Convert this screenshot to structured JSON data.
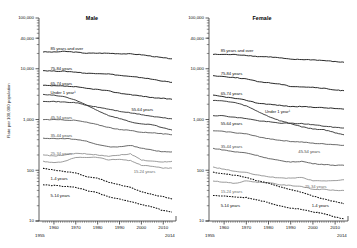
{
  "chart_data": {
    "type": "line",
    "title": "",
    "ylabel": "Rate per 100,000 population",
    "xlabel": "",
    "scale": "log",
    "grid": false,
    "legend_position": "inline-labels",
    "xlim": [
      1955,
      2014
    ],
    "ylim": [
      10,
      100000
    ],
    "ytick_labels": [
      "100,000",
      "40,000",
      "10,000",
      "1,000",
      "100",
      "10"
    ],
    "ytick_values": [
      100000,
      40000,
      10000,
      1000,
      100,
      10
    ],
    "xtick_labels": [
      "1960",
      "1970",
      "1980",
      "1990",
      "2000",
      "2010"
    ],
    "xtick_values": [
      1960,
      1970,
      1980,
      1990,
      2000,
      2010
    ],
    "x_start_label": "1955",
    "x_end_label": "2014",
    "x": [
      1955,
      1960,
      1965,
      1970,
      1975,
      1980,
      1985,
      1990,
      1995,
      2000,
      2005,
      2010,
      2014
    ],
    "panels": [
      {
        "name": "Male",
        "series": [
          {
            "name": "85 years and over",
            "values": [
              21500,
              21300,
              22000,
              21200,
              20200,
              20300,
              20200,
              19800,
              19600,
              18900,
              17600,
              16400,
              15700
            ]
          },
          {
            "name": "75-84 years",
            "values": [
              9200,
              9000,
              8900,
              8600,
              8100,
              8100,
              7900,
              7400,
              7000,
              6700,
              6200,
              5700,
              5400
            ]
          },
          {
            "name": "65-74 years",
            "values": [
              4700,
              4600,
              4550,
              4400,
              4100,
              3900,
              3650,
              3300,
              3100,
              2900,
              2700,
              2600,
              2500
            ]
          },
          {
            "name": "Under 1 year",
            "values": [
              3100,
              3000,
              2800,
              2400,
              1900,
              1500,
              1200,
              1050,
              900,
              810,
              790,
              680,
              620
            ]
          },
          {
            "name": "55-64 years",
            "values": [
              2300,
              2260,
              2200,
              2150,
              1900,
              1750,
              1600,
              1450,
              1350,
              1250,
              1150,
              1080,
              1030
            ]
          },
          {
            "name": "45-54 years",
            "values": [
              1000,
              990,
              980,
              960,
              880,
              790,
              700,
              630,
              610,
              560,
              550,
              520,
              500
            ]
          },
          {
            "name": "35-44 years",
            "values": [
              430,
              420,
              420,
              410,
              370,
              320,
              290,
              290,
              310,
              270,
              250,
              230,
              230
            ]
          },
          {
            "name": "25-34 years",
            "values": [
              200,
              190,
              200,
              215,
              210,
              200,
              190,
              200,
              210,
              160,
              150,
              145,
              150
            ]
          },
          {
            "name": "15-24 years",
            "values": [
              150,
              140,
              150,
              180,
              180,
              180,
              160,
              165,
              155,
              125,
              120,
              110,
              110
            ]
          },
          {
            "name": "1-4 years",
            "values": [
              110,
              100,
              95,
              88,
              75,
              70,
              58,
              52,
              46,
              38,
              33,
              30,
              27
            ]
          },
          {
            "name": "5-14 years",
            "values": [
              52,
              50,
              48,
              46,
              40,
              36,
              30,
              27,
              24,
              21,
              19,
              16,
              15
            ]
          }
        ]
      },
      {
        "name": "Female",
        "series": [
          {
            "name": "85 years and over",
            "values": [
              19200,
              19100,
              19000,
              18400,
              17400,
              17200,
              16400,
              15300,
              15200,
              15000,
              14500,
              13800,
              13400
            ]
          },
          {
            "name": "75-84 years",
            "values": [
              7300,
              7000,
              6700,
              6300,
              5600,
              5300,
              5000,
              4500,
              4400,
              4300,
              4100,
              3800,
              3700
            ]
          },
          {
            "name": "65-74 years",
            "values": [
              3000,
              2800,
              2600,
              2400,
              2100,
              2000,
              1900,
              1800,
              1800,
              1750,
              1700,
              1650,
              1600
            ]
          },
          {
            "name": "Under 1 year",
            "values": [
              2400,
              2300,
              2150,
              1850,
              1450,
              1150,
              950,
              830,
              720,
              650,
              630,
              550,
              500
            ]
          },
          {
            "name": "55-64 years",
            "values": [
              1200,
              1180,
              1100,
              1050,
              950,
              900,
              850,
              840,
              830,
              790,
              740,
              700,
              680
            ]
          },
          {
            "name": "45-54 years",
            "values": [
              600,
              580,
              550,
              520,
              460,
              420,
              390,
              370,
              360,
              340,
              330,
              320,
              310
            ]
          },
          {
            "name": "35-44 years",
            "values": [
              270,
              250,
              230,
              220,
              195,
              170,
              155,
              145,
              150,
              135,
              130,
              125,
              125
            ]
          },
          {
            "name": "25-34 years",
            "values": [
              115,
              105,
              95,
              90,
              80,
              75,
              70,
              70,
              72,
              62,
              62,
              62,
              65
            ]
          },
          {
            "name": "15-24 years",
            "values": [
              62,
              58,
              55,
              62,
              58,
              57,
              52,
              50,
              48,
              42,
              42,
              40,
              40
            ]
          },
          {
            "name": "5-14 years",
            "values": [
              32,
              31,
              30,
              29,
              26,
              23,
              20,
              18,
              17,
              15,
              14,
              12,
              11
            ]
          },
          {
            "name": "1-4 years",
            "values": [
              92,
              85,
              80,
              72,
              62,
              56,
              47,
              42,
              37,
              31,
              27,
              24,
              22
            ]
          }
        ]
      }
    ]
  },
  "axes": {
    "ylabel": "Rate per 100,000 population",
    "yticks": [
      "100,000",
      "40,000",
      "10,000",
      "1,000",
      "100",
      "10"
    ],
    "xticks": [
      "1960",
      "1970",
      "1980",
      "1990",
      "2000",
      "2010"
    ],
    "x_start": "1955",
    "x_end": "2014"
  },
  "panels": {
    "male": {
      "title": "Male",
      "labels": [
        "85 years and over",
        "75-84 years",
        "65-74 years",
        "Under 1 year¹",
        "55-64 years",
        "45-54 years",
        "35-44 years",
        "25-34 years",
        "15-24 years",
        "1-4 years",
        "5-14 years"
      ]
    },
    "female": {
      "title": "Female",
      "labels": [
        "85 years and over",
        "75-84 years",
        "65-74 years",
        "Under 1 year¹",
        "55-64 years",
        "45-54 years",
        "35-44 years",
        "25-34 years",
        "15-24 years",
        "5-14 years",
        "1-4 years"
      ]
    }
  },
  "colors": {
    "dark": "#1a1a1a",
    "mid": "#4a4a4a",
    "gray": "#7d7d7d",
    "axis": "#333333"
  }
}
